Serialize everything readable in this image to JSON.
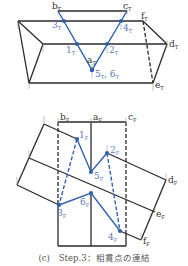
{
  "colors": {
    "line": "#2a2a2a",
    "accent": "#2f5fb3",
    "label_blue": "#5a79b8",
    "tick": "#999999"
  },
  "top_diagram": {
    "labels": {
      "b": "b",
      "c": "c",
      "f": "f",
      "d": "d",
      "e": "e",
      "a": "a",
      "sub": "T",
      "p3": "3",
      "p4": "4",
      "p1": "1",
      "p2": "2",
      "p56": "5",
      "p56b": "6"
    }
  },
  "bottom_diagram": {
    "labels": {
      "b": "b",
      "a": "a",
      "c": "c",
      "d": "d",
      "e": "e",
      "f": "f",
      "sub": "F",
      "p1": "1",
      "p2": "2",
      "p5": "5",
      "p6": "6",
      "p3": "3",
      "p4": "4"
    }
  },
  "caption": "(c)　Step.3：相貫点の連結"
}
